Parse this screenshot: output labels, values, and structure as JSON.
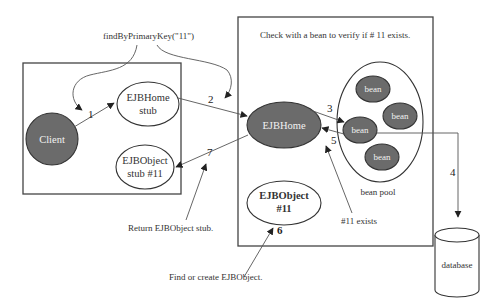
{
  "diagram": {
    "annotations": {
      "find_call": "findByPrimaryKey(\"11\")",
      "check_bean": "Check with a bean to verify if # 11 exists.",
      "return_stub": "Return EJBObject stub.",
      "find_or_create": "Find or  create EJBObject.",
      "exists": "#11 exists"
    },
    "containers": {
      "client_side": "client-container",
      "server_side": "ejb-container"
    },
    "nodes": {
      "client": {
        "label": "Client",
        "style": "dark"
      },
      "home_stub": {
        "line1": "EJBHome",
        "line2": "stub",
        "style": "light"
      },
      "object_stub": {
        "line1": "EJBObject",
        "line2": "stub #11",
        "style": "light"
      },
      "ejb_home": {
        "label": "EJBHome",
        "style": "dark"
      },
      "ejb_object": {
        "line1": "EJBObject",
        "line2": "#11",
        "style": "light"
      },
      "bean_pool": {
        "label": "bean pool"
      },
      "beans": [
        {
          "label": "bean"
        },
        {
          "label": "bean"
        },
        {
          "label": "bean"
        },
        {
          "label": "bean"
        }
      ],
      "database": {
        "label": "database"
      }
    },
    "steps": {
      "s1": "1",
      "s2": "2",
      "s3": "3",
      "s4": "4",
      "s5": "5",
      "s6": "6",
      "s7": "7"
    },
    "edges": [
      {
        "from": "client",
        "to": "home_stub",
        "step": "1"
      },
      {
        "from": "home_stub",
        "to": "ejb_home",
        "step": "2"
      },
      {
        "from": "ejb_home",
        "to": "bean",
        "step": "3"
      },
      {
        "from": "bean",
        "to": "database",
        "step": "4"
      },
      {
        "from": "bean",
        "to": "ejb_home",
        "step": "5"
      },
      {
        "from": "find_or_create",
        "to": "ejb_object",
        "step": "6"
      },
      {
        "from": "ejb_home",
        "to": "object_stub",
        "step": "7"
      }
    ],
    "colors": {
      "dark_node": "#6b6b6b",
      "outline": "#333333",
      "text": "#333333"
    }
  }
}
